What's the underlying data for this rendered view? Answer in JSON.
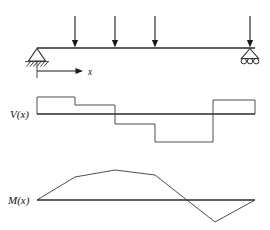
{
  "figure": {
    "labels": {
      "x_axis": "x",
      "shear": "V(x)",
      "moment": "M(x)"
    },
    "colors": {
      "ink": "#1a1a1a",
      "line": "#2a2a2a",
      "thin_line": "#3a3a3a",
      "background": "#ffffff"
    }
  },
  "beam": {
    "name": "beam-member",
    "y": 48,
    "x_start": 37,
    "x_end": 255,
    "supports": [
      {
        "name": "pin-support",
        "type": "pin",
        "x": 37,
        "y": 48
      },
      {
        "name": "roller-support",
        "type": "roller",
        "x": 250,
        "y": 48
      }
    ],
    "loads": [
      {
        "name": "point-load-1",
        "x": 75,
        "y_tail": 16,
        "y_head": 47,
        "direction": "down"
      },
      {
        "name": "point-load-2",
        "x": 115,
        "y_tail": 16,
        "y_head": 47,
        "direction": "down"
      },
      {
        "name": "point-load-3",
        "x": 155,
        "y_tail": 16,
        "y_head": 47,
        "direction": "down"
      },
      {
        "name": "point-load-4",
        "x": 250,
        "y_tail": 16,
        "y_head": 47,
        "direction": "down"
      }
    ],
    "x_axis_arrow": {
      "name": "x-axis-arrow",
      "tick_x": 37,
      "tick_y_top": 62,
      "tick_y_bottom": 78,
      "line_y": 71,
      "line_x_end": 82,
      "label_x": 88,
      "label_y": 75
    }
  },
  "chart_data": [
    {
      "type": "step",
      "name": "shear-diagram",
      "title": "V(x)",
      "baseline_y": 114,
      "x_start": 37,
      "x_end": 255,
      "label_position": {
        "x": 10,
        "y": 118
      },
      "segments": [
        {
          "x_from": 37,
          "x_to": 75,
          "value": 17
        },
        {
          "x_from": 75,
          "x_to": 115,
          "value": 9
        },
        {
          "x_from": 115,
          "x_to": 155,
          "value": -10
        },
        {
          "x_from": 155,
          "x_to": 213,
          "value": -28
        },
        {
          "x_from": 213,
          "x_to": 255,
          "value": 14
        }
      ],
      "jump_locations": [
        75,
        115,
        155,
        213
      ],
      "polyline": "37,114 37,97 75,97 75,105 115,105 115,124 155,124 155,142 213,142 213,100 255,100 255,114"
    },
    {
      "type": "line",
      "name": "moment-diagram",
      "title": "M(x)",
      "baseline_y": 200,
      "x_start": 37,
      "x_end": 255,
      "label_position": {
        "x": 8,
        "y": 204
      },
      "points": [
        {
          "x": 37,
          "y": 200,
          "value": 0
        },
        {
          "x": 75,
          "y": 177,
          "value": 23
        },
        {
          "x": 115,
          "y": 170,
          "value": 30
        },
        {
          "x": 155,
          "y": 175,
          "value": 25
        },
        {
          "x": 193,
          "y": 200,
          "value": 0
        },
        {
          "x": 215,
          "y": 222,
          "value": -22
        },
        {
          "x": 255,
          "y": 200,
          "value": 0
        }
      ],
      "polyline": "37,200 75,177 115,170 155,175 215,222 255,200",
      "zero_crossings": [
        193
      ]
    }
  ]
}
